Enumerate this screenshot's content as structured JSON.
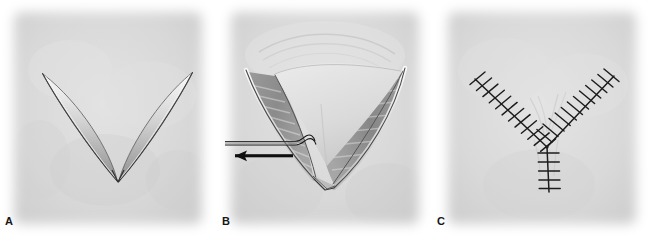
{
  "figure": {
    "background_color": "#ffffff",
    "panel_background_color": "#d9d9d9",
    "width": 649,
    "height": 250
  },
  "panels": [
    {
      "id": "A",
      "label": "A",
      "caption": "V-shaped incision marked on skin",
      "stage": "incision",
      "icon_name": "v-incision-illustration",
      "colors": {
        "skin": "#d7d7d7",
        "incision_line": "#4a4a4a",
        "incision_highlight": "#f2f2f2"
      },
      "geometry": {
        "apex": [
          118,
          182
        ],
        "left_tip": [
          42,
          73
        ],
        "right_tip": [
          192,
          72
        ]
      }
    },
    {
      "id": "B",
      "label": "B",
      "caption": "Flap elevated and advanced; traction suture at apex with arrows showing direction of advancement",
      "stage": "flap-advancement",
      "icon_name": "retracted-flap-illustration",
      "colors": {
        "skin": "#d7d7d7",
        "wound_bed": "#8c8c8c",
        "wound_bed_dark": "#6e6e6e",
        "flap_pale": "#dcdcdc",
        "edge_line": "#3d3d3d",
        "suture_thread": "#1a1a1a",
        "arrow": "#111111"
      },
      "annotations": [
        {
          "name": "traction-suture",
          "type": "thread",
          "from": [
            226,
            143
          ],
          "to": [
            305,
            143
          ]
        },
        {
          "name": "advancement-arrow",
          "type": "arrow",
          "direction": "left",
          "from": [
            289,
            156
          ],
          "to": [
            228,
            156
          ]
        }
      ]
    },
    {
      "id": "C",
      "label": "C",
      "caption": "Y-shaped closure with interrupted sutures",
      "stage": "closure",
      "icon_name": "y-closure-sutures-illustration",
      "colors": {
        "skin": "#d7d7d7",
        "suture": "#1c1c1c",
        "scar_line": "#b9b9b9"
      },
      "suture_lines": [
        {
          "name": "left-limb",
          "from": [
            476,
            79
          ],
          "to": [
            547,
            147
          ],
          "stitch_count": 12
        },
        {
          "name": "right-limb",
          "from": [
            613,
            76
          ],
          "to": [
            547,
            147
          ],
          "stitch_count": 12
        },
        {
          "name": "vertical-stem",
          "from": [
            547,
            147
          ],
          "to": [
            549,
            192
          ],
          "stitch_count": 5
        }
      ]
    }
  ]
}
